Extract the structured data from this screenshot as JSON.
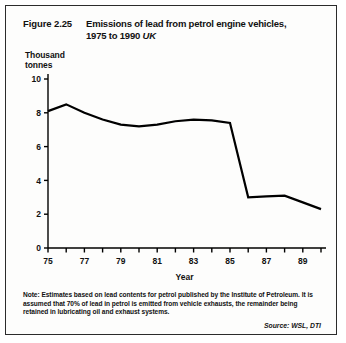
{
  "figure": {
    "number": "Figure 2.25",
    "title_line1": "Emissions of  lead from petrol engine vehicles,",
    "title_line2": "1975 to 1990",
    "region": "UK"
  },
  "axis": {
    "y_label_line1": "Thousand",
    "y_label_line2": "tonnes",
    "x_label": "Year"
  },
  "note": {
    "line1": "Note: Estimates based on lead contents for petrol published by the Institute of",
    "line2": "Petroleum. It is assumed that 70% of lead in petrol is emitted from vehicle exhausts,",
    "line3": "the remainder being retained in lubricating oil and exhaust systems."
  },
  "source": "Source: WSL, DTI",
  "colors": {
    "line": "#000000",
    "axis": "#000000",
    "background": "#fdfdfc",
    "border": "#2b2b2b"
  },
  "chart_data": {
    "type": "line",
    "title": "Emissions of lead from petrol engine vehicles, 1975 to 1990 UK",
    "xlabel": "Year",
    "ylabel": "Thousand tonnes",
    "xlim": [
      1975,
      1990
    ],
    "ylim": [
      0,
      10
    ],
    "ytick_values": [
      0,
      2,
      4,
      6,
      8,
      10
    ],
    "ytick_labels": [
      "0",
      "2",
      "4",
      "6",
      "8",
      "10"
    ],
    "xtick_values": [
      1975,
      1976,
      1977,
      1978,
      1979,
      1980,
      1981,
      1982,
      1983,
      1984,
      1985,
      1986,
      1987,
      1988,
      1989,
      1990
    ],
    "xtick_labels_shown": [
      "75",
      "",
      "77",
      "",
      "79",
      "",
      "81",
      "",
      "83",
      "",
      "85",
      "",
      "87",
      "",
      "89",
      ""
    ],
    "grid": false,
    "legend": false,
    "x": [
      1975,
      1976,
      1977,
      1978,
      1979,
      1980,
      1981,
      1982,
      1983,
      1984,
      1985,
      1986,
      1987,
      1988,
      1989,
      1990
    ],
    "values": [
      8.1,
      8.5,
      8.0,
      7.6,
      7.3,
      7.2,
      7.3,
      7.5,
      7.6,
      7.55,
      7.4,
      3.0,
      3.05,
      3.1,
      2.7,
      2.3
    ],
    "series": [
      {
        "name": "Lead emissions from petrol engine vehicles",
        "values": [
          8.1,
          8.5,
          8.0,
          7.6,
          7.3,
          7.2,
          7.3,
          7.5,
          7.6,
          7.55,
          7.4,
          3.0,
          3.05,
          3.1,
          2.7,
          2.3
        ]
      }
    ]
  }
}
